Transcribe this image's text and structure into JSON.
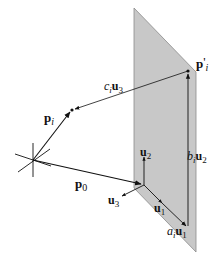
{
  "diagram": {
    "colors": {
      "plane_fill": "#c8c8c8",
      "plane_edge": "#8a8a8a",
      "line": "#111111",
      "background": "#ffffff"
    },
    "labels": {
      "p_prime_i": {
        "base": "p",
        "prime": "'",
        "sub": "i"
      },
      "c_i_u3": {
        "coef": "c",
        "coef_sub": "i",
        "vec": "u",
        "vec_sub": "3"
      },
      "p_i": {
        "base": "p",
        "sub": "i"
      },
      "p_0": {
        "base": "p",
        "sub": "0"
      },
      "u_2": {
        "base": "u",
        "sub": "2"
      },
      "u_3": {
        "base": "u",
        "sub": "3"
      },
      "u_1": {
        "base": "u",
        "sub": "1"
      },
      "a_i_u1": {
        "coef": "a",
        "coef_sub": "i",
        "vec": "u",
        "vec_sub": "1"
      },
      "b_i_u2": {
        "coef": "b",
        "coef_sub": "i",
        "vec": "u",
        "vec_sub": "2"
      }
    },
    "nodes": [
      {
        "id": "origin",
        "label": "world origin (coordinate axes star)"
      },
      {
        "id": "p_i",
        "label": "point p_i"
      },
      {
        "id": "p_prime_i",
        "label": "projected point p'_i on plane"
      },
      {
        "id": "plane_origin",
        "label": "plane origin at p_0"
      }
    ],
    "edges": [
      {
        "from": "origin",
        "to": "p_i",
        "label": "p_i"
      },
      {
        "from": "origin",
        "to": "plane_origin",
        "label": "p_0"
      },
      {
        "from": "p_prime_i",
        "to": "p_i",
        "label": "c_i u_3"
      },
      {
        "from": "plane_origin",
        "to": "u1_tip",
        "label": "u_1"
      },
      {
        "from": "plane_origin",
        "to": "u2_tip",
        "label": "u_2"
      },
      {
        "from": "plane_origin",
        "to": "u3_tip",
        "label": "u_3"
      },
      {
        "from": "plane_origin",
        "to": "a_i_u1_tip",
        "label": "a_i u_1"
      },
      {
        "from": "a_i_u1_tip",
        "to": "p_prime_i",
        "label": "b_i u_2"
      }
    ]
  }
}
